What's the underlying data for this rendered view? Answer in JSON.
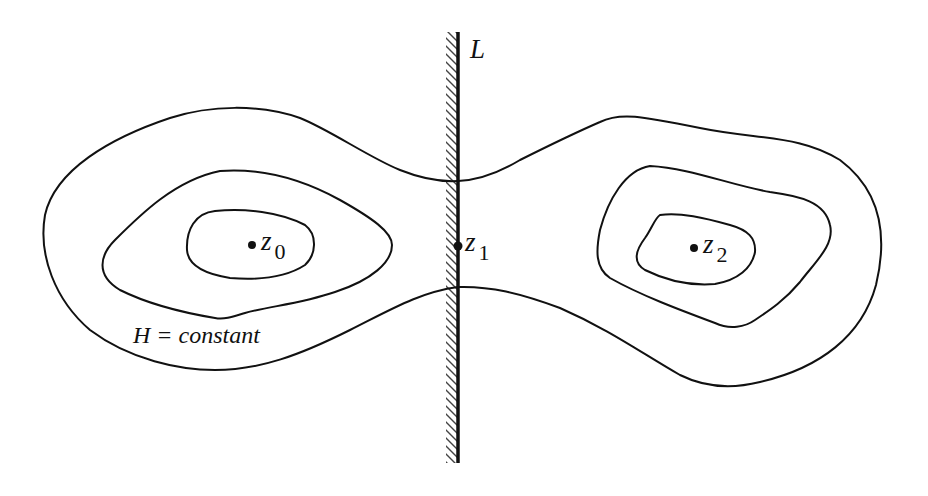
{
  "figure": {
    "type": "level-set diagram",
    "wall": {
      "label": "L",
      "x": 458,
      "y_top": 32,
      "y_bottom": 463,
      "hatch_side": "left",
      "color": "#111111"
    },
    "contour_label": {
      "text": "H = constant"
    },
    "points": [
      {
        "id": "z0",
        "base": "z",
        "subscript": "0",
        "x": 252,
        "y": 245
      },
      {
        "id": "z1",
        "base": "z",
        "subscript": "1",
        "x": 458,
        "y": 246
      },
      {
        "id": "z2",
        "base": "z",
        "subscript": "2",
        "x": 694,
        "y": 248
      }
    ],
    "stroke_color": "#111111",
    "background": "#ffffff"
  },
  "labels": {
    "wall": "L",
    "h_constant": "H = constant",
    "z0_base": "z",
    "z0_sub": "0",
    "z1_base": "z",
    "z1_sub": "1",
    "z2_base": "z",
    "z2_sub": "2"
  }
}
